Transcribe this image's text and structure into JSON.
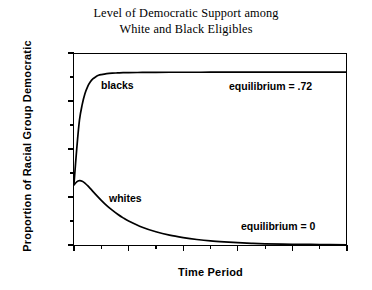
{
  "figure": {
    "title_line1": "Level of Democratic Support among",
    "title_line2": "White and Black Eligibles"
  },
  "axes": {
    "xlabel": "Time Period",
    "ylabel": "Proportion of Racial Group Democratic",
    "xticks": [
      "0",
      "20",
      "40",
      "60",
      "80",
      "100"
    ],
    "yticks": [
      "0",
      "0.2",
      "0.4",
      "0.6",
      "0.8"
    ]
  },
  "annotations": {
    "blacks_label": "blacks",
    "whites_label": "whites",
    "equilibrium_blacks": "equilibrium = .72",
    "equilibrium_whites": "equilibrium = 0"
  },
  "chart_data": {
    "type": "line",
    "title": "Level of Democratic Support among White and Black Eligibles",
    "xlabel": "Time Period",
    "ylabel": "Proportion of Racial Group Democratic",
    "xlim": [
      0,
      100
    ],
    "ylim": [
      0,
      0.8
    ],
    "xticks": [
      0,
      20,
      40,
      60,
      80,
      100
    ],
    "xticks_minor": [
      10,
      30,
      50,
      70,
      90
    ],
    "yticks": [
      0,
      0.2,
      0.4,
      0.6,
      0.8
    ],
    "yticks_minor": [
      0.1,
      0.3,
      0.5,
      0.7
    ],
    "grid": false,
    "legend": "inline-labels",
    "line_color": "#000000",
    "series": [
      {
        "name": "blacks",
        "equilibrium": 0.72,
        "x": [
          0,
          1,
          2,
          3,
          4,
          5,
          6,
          7,
          8,
          9,
          10,
          12,
          14,
          16,
          18,
          20,
          25,
          30,
          35,
          40,
          50,
          60,
          70,
          80,
          90,
          100
        ],
        "values": [
          0.255,
          0.4,
          0.52,
          0.585,
          0.63,
          0.66,
          0.68,
          0.693,
          0.701,
          0.707,
          0.71,
          0.714,
          0.716,
          0.717,
          0.718,
          0.7185,
          0.719,
          0.7195,
          0.7197,
          0.7198,
          0.7199,
          0.72,
          0.72,
          0.72,
          0.72,
          0.72
        ]
      },
      {
        "name": "whites",
        "equilibrium": 0.0,
        "x": [
          0,
          1,
          2,
          3,
          4,
          5,
          6,
          8,
          10,
          12,
          14,
          16,
          18,
          20,
          25,
          30,
          35,
          40,
          45,
          50,
          55,
          60,
          65,
          70,
          80,
          90,
          100
        ],
        "values": [
          0.25,
          0.263,
          0.268,
          0.266,
          0.258,
          0.247,
          0.235,
          0.21,
          0.186,
          0.164,
          0.145,
          0.128,
          0.113,
          0.1,
          0.074,
          0.055,
          0.041,
          0.031,
          0.023,
          0.017,
          0.013,
          0.01,
          0.007,
          0.005,
          0.003,
          0.002,
          0.001
        ]
      }
    ]
  }
}
